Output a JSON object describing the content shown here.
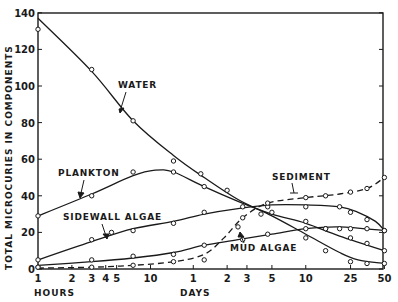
{
  "chart_data": {
    "type": "line",
    "title": "",
    "xlabel": "Time (log scale): HOURS / DAYS",
    "ylabel": "TOTAL MICROCURIES IN COMPONENTS",
    "ylim": [
      0,
      140
    ],
    "xscale": "log",
    "x_unit": "hours",
    "xlim_hours": [
      1,
      1200
    ],
    "grid": false,
    "y_ticks": [
      0,
      20,
      40,
      60,
      80,
      100,
      120,
      140
    ],
    "x_ticks": [
      {
        "label": "1",
        "hours": 1
      },
      {
        "label": "2",
        "hours": 2
      },
      {
        "label": "3",
        "hours": 3
      },
      {
        "label": "4",
        "hours": 4
      },
      {
        "label": "5",
        "hours": 5
      },
      {
        "label": "10",
        "hours": 10
      },
      {
        "label": "1",
        "hours": 24
      },
      {
        "label": "2",
        "hours": 48
      },
      {
        "label": "3",
        "hours": 72
      },
      {
        "label": "5",
        "hours": 120
      },
      {
        "label": "10",
        "hours": 240
      },
      {
        "label": "25",
        "hours": 600
      },
      {
        "label": "50",
        "hours": 1200
      }
    ],
    "x_unit_labels": [
      {
        "text": "HOURS",
        "at_hours": 1
      },
      {
        "text": "DAYS",
        "at_hours": 24
      }
    ],
    "series": [
      {
        "name": "WATER",
        "style": "solid",
        "points": [
          [
            1,
            131
          ],
          [
            3,
            109
          ],
          [
            7,
            81
          ],
          [
            16,
            59
          ],
          [
            28,
            52
          ],
          [
            48,
            43
          ],
          [
            96,
            30
          ],
          [
            240,
            17
          ],
          [
            360,
            10
          ],
          [
            600,
            4
          ],
          [
            840,
            3
          ],
          [
            1200,
            3
          ]
        ],
        "curve": [
          [
            1,
            137
          ],
          [
            3,
            108
          ],
          [
            7,
            81
          ],
          [
            16,
            62
          ],
          [
            30,
            50
          ],
          [
            60,
            38
          ],
          [
            120,
            29
          ],
          [
            240,
            19
          ],
          [
            480,
            9
          ],
          [
            700,
            5
          ],
          [
            1200,
            3
          ]
        ]
      },
      {
        "name": "PLANKTON",
        "style": "solid",
        "points": [
          [
            1,
            29
          ],
          [
            3,
            40
          ],
          [
            7,
            53
          ],
          [
            16,
            53
          ],
          [
            30,
            45
          ],
          [
            120,
            31
          ],
          [
            240,
            26
          ],
          [
            360,
            22
          ],
          [
            600,
            17
          ],
          [
            840,
            14
          ],
          [
            1200,
            10
          ]
        ],
        "curve": [
          [
            1,
            29
          ],
          [
            3,
            41
          ],
          [
            7,
            51
          ],
          [
            11,
            54
          ],
          [
            16,
            53
          ],
          [
            30,
            45
          ],
          [
            60,
            37
          ],
          [
            120,
            30
          ],
          [
            240,
            25
          ],
          [
            480,
            18
          ],
          [
            1200,
            10
          ]
        ]
      },
      {
        "name": "SIDEWALL ALGAE",
        "style": "solid",
        "points": [
          [
            1,
            5
          ],
          [
            3,
            16
          ],
          [
            4.5,
            20
          ],
          [
            7,
            21
          ],
          [
            16,
            25
          ],
          [
            30,
            31
          ],
          [
            66,
            34
          ],
          [
            110,
            34
          ],
          [
            240,
            34
          ],
          [
            480,
            34
          ],
          [
            600,
            31
          ],
          [
            840,
            27
          ],
          [
            1200,
            21
          ]
        ],
        "curve": [
          [
            1,
            5
          ],
          [
            3,
            15
          ],
          [
            7,
            22
          ],
          [
            16,
            26
          ],
          [
            30,
            30
          ],
          [
            60,
            33
          ],
          [
            120,
            35
          ],
          [
            240,
            35
          ],
          [
            480,
            34
          ],
          [
            700,
            31
          ],
          [
            1000,
            26
          ],
          [
            1200,
            21
          ]
        ]
      },
      {
        "name": "MUD ALGAE",
        "style": "solid",
        "points": [
          [
            1,
            1
          ],
          [
            3,
            5
          ],
          [
            7,
            7
          ],
          [
            16,
            8
          ],
          [
            30,
            13
          ],
          [
            66,
            16
          ],
          [
            110,
            19
          ],
          [
            240,
            22
          ],
          [
            360,
            22
          ],
          [
            480,
            22
          ],
          [
            600,
            22
          ],
          [
            840,
            22
          ],
          [
            1200,
            21
          ]
        ],
        "curve": [
          [
            1,
            2
          ],
          [
            3,
            4
          ],
          [
            7,
            6
          ],
          [
            16,
            9
          ],
          [
            30,
            13
          ],
          [
            60,
            16
          ],
          [
            120,
            19
          ],
          [
            240,
            22
          ],
          [
            480,
            23
          ],
          [
            1200,
            21
          ]
        ]
      },
      {
        "name": "SEDIMENT",
        "style": "dashed",
        "points": [
          [
            1,
            1
          ],
          [
            3,
            1
          ],
          [
            7,
            2
          ],
          [
            16,
            4
          ],
          [
            30,
            5
          ],
          [
            60,
            23
          ],
          [
            66,
            28
          ],
          [
            110,
            36
          ],
          [
            240,
            39
          ],
          [
            360,
            40
          ],
          [
            600,
            42
          ],
          [
            840,
            44
          ],
          [
            1200,
            50
          ]
        ],
        "curve": [
          [
            1,
            0.5
          ],
          [
            3,
            1
          ],
          [
            7,
            2
          ],
          [
            16,
            4
          ],
          [
            30,
            8
          ],
          [
            45,
            17
          ],
          [
            66,
            28
          ],
          [
            110,
            36
          ],
          [
            240,
            39
          ],
          [
            480,
            41
          ],
          [
            840,
            44
          ],
          [
            1200,
            50
          ]
        ]
      }
    ],
    "annotations": [
      {
        "text": "WATER",
        "points_to_series": "WATER"
      },
      {
        "text": "PLANKTON",
        "points_to_series": "PLANKTON"
      },
      {
        "text": "SIDEWALL ALGAE",
        "points_to_series": "SIDEWALL ALGAE"
      },
      {
        "text": "MUD ALGAE",
        "points_to_series": "MUD ALGAE"
      },
      {
        "text": "SEDIMENT",
        "points_to_series": "SEDIMENT"
      }
    ]
  },
  "labels": {
    "ylabel": "TOTAL MICROCURIES IN COMPONENTS",
    "hours": "HOURS",
    "days": "DAYS",
    "water": "WATER",
    "plankton": "PLANKTON",
    "sidewall": "SIDEWALL ALGAE",
    "mud": "MUD ALGAE",
    "sediment": "SEDIMENT"
  }
}
